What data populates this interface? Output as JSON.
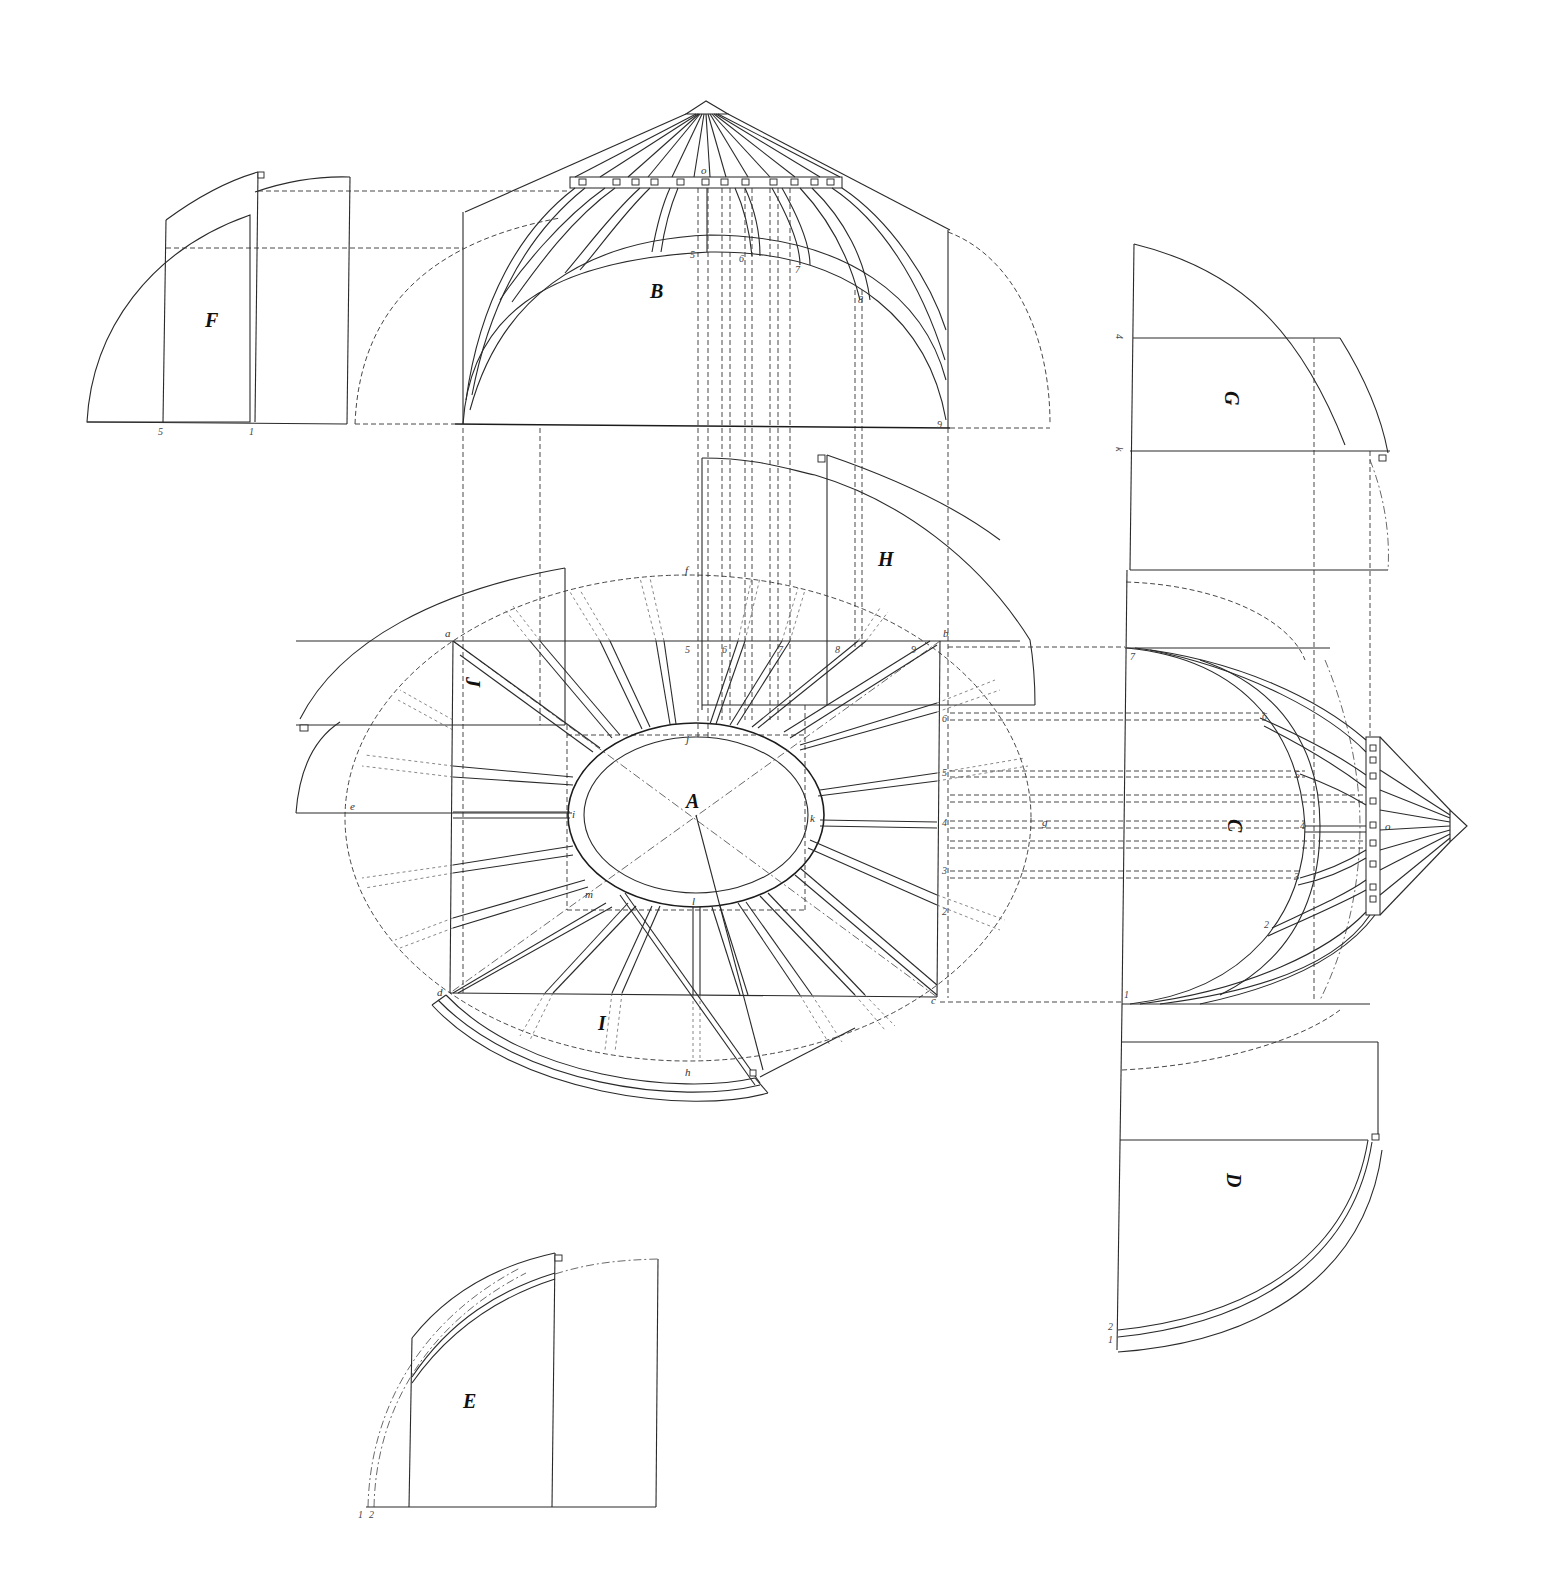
{
  "plate": {
    "title": "",
    "background": "#ffffff",
    "ink": "#222222"
  },
  "panels": {
    "A": {
      "label": "A",
      "desc": "plan of elliptical crown ring"
    },
    "B": {
      "label": "B",
      "desc": "front elevation of roof framing"
    },
    "C": {
      "label": "C",
      "desc": "side elevation of roof framing"
    },
    "D": {
      "label": "D",
      "desc": "rafter development, right lower"
    },
    "E": {
      "label": "E",
      "desc": "rafter development, lower left"
    },
    "F": {
      "label": "F",
      "desc": "rafter development, upper left"
    },
    "G": {
      "label": "G",
      "desc": "rafter development, right upper"
    },
    "H": {
      "label": "H",
      "desc": "rafter development, over plan"
    },
    "I": {
      "label": "I",
      "desc": "rafter development, below plan"
    },
    "J": {
      "label": "J",
      "desc": "rafter development, left of plan"
    }
  },
  "points": {
    "a": "a",
    "b": "b",
    "c": "c",
    "d": "d",
    "e": "e",
    "f": "f",
    "g": "g",
    "h": "h",
    "i": "i",
    "j": "j",
    "k": "k",
    "l": "l",
    "m": "m",
    "o_top": "o",
    "o_side": "o"
  },
  "numbers": {
    "B_elev": [
      "5",
      "6",
      "7",
      "8",
      "9"
    ],
    "plan_top": [
      "5",
      "6",
      "7",
      "8",
      "9"
    ],
    "plan_right": [
      "6",
      "5",
      "4",
      "3",
      "2",
      "1"
    ],
    "C_elev": [
      "7",
      "6",
      "5",
      "4",
      "3",
      "2",
      "1"
    ],
    "F_base": [
      "5",
      "1"
    ],
    "G_side": [
      "4",
      "k"
    ],
    "D_base": [
      "2",
      "1"
    ],
    "E_base": [
      "1",
      "2"
    ]
  }
}
